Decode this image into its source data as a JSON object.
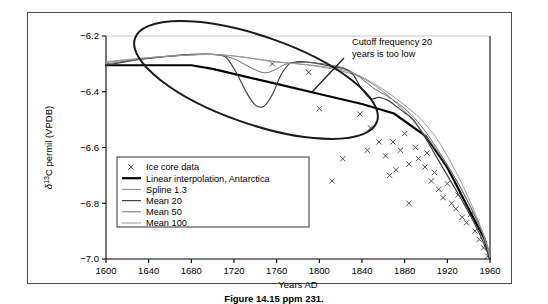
{
  "figure": {
    "caption": "Figure 14.15 ppm 231.",
    "frame_color": "#4a4a4a"
  },
  "annotation": {
    "line1": "Cutoff frequency 20",
    "line2": "years is too low",
    "ellipse_label": "highlight-ellipse"
  },
  "chart_data": {
    "type": "line",
    "title": "",
    "xlabel": "Years AD",
    "ylabel": "δ¹³C permil (VPDB)",
    "xlim": [
      1600,
      1960
    ],
    "ylim": [
      -7.0,
      -6.2
    ],
    "xticks": [
      1600,
      1640,
      1680,
      1720,
      1760,
      1800,
      1840,
      1880,
      1920,
      1960
    ],
    "yticks": [
      -6.2,
      -6.4,
      -6.6,
      -6.8,
      -7.0
    ],
    "xtick_labels": [
      "1600",
      "1640",
      "1680",
      "1720",
      "1760",
      "1800",
      "1840",
      "1880",
      "1920",
      "1960"
    ],
    "ytick_labels": [
      "−6.2",
      "−6.4",
      "−6.6",
      "−6.8",
      "−7.0"
    ],
    "grid": false,
    "legend_position": "lower-left",
    "legend": [
      {
        "label": "Ice core data",
        "marker": "x",
        "color": "#555555"
      },
      {
        "label": "Linear interpolation, Antarctica",
        "marker": "line",
        "color": "#000000",
        "width": 2.2
      },
      {
        "label": "Spline 1.3",
        "marker": "line",
        "color": "#8a8a8a",
        "width": 1.0
      },
      {
        "label": "Mean 20",
        "marker": "line",
        "color": "#404040",
        "width": 1.2
      },
      {
        "label": "Mean 50",
        "marker": "line",
        "color": "#6b6b6b",
        "width": 1.0
      },
      {
        "label": "Mean 100",
        "marker": "line",
        "color": "#9a9a9a",
        "width": 1.0
      }
    ],
    "series": [
      {
        "name": "Ice core data",
        "type": "scatter",
        "points": [
          [
            1756,
            -6.3
          ],
          [
            1790,
            -6.33
          ],
          [
            1800,
            -6.46
          ],
          [
            1838,
            -6.48
          ],
          [
            1848,
            -6.53
          ],
          [
            1856,
            -6.58
          ],
          [
            1845,
            -6.61
          ],
          [
            1822,
            -6.64
          ],
          [
            1862,
            -6.63
          ],
          [
            1869,
            -6.58
          ],
          [
            1880,
            -6.55
          ],
          [
            1876,
            -6.61
          ],
          [
            1884,
            -6.66
          ],
          [
            1812,
            -6.72
          ],
          [
            1890,
            -6.6
          ],
          [
            1893,
            -6.64
          ],
          [
            1899,
            -6.67
          ],
          [
            1905,
            -6.72
          ],
          [
            1908,
            -6.69
          ],
          [
            1912,
            -6.75
          ],
          [
            1916,
            -6.78
          ],
          [
            1920,
            -6.73
          ],
          [
            1924,
            -6.8
          ],
          [
            1928,
            -6.82
          ],
          [
            1930,
            -6.77
          ],
          [
            1934,
            -6.85
          ],
          [
            1938,
            -6.87
          ],
          [
            1942,
            -6.84
          ],
          [
            1946,
            -6.9
          ],
          [
            1950,
            -6.93
          ],
          [
            1954,
            -6.96
          ],
          [
            1958,
            -6.99
          ],
          [
            1884,
            -6.8
          ],
          [
            1866,
            -6.7
          ],
          [
            1872,
            -6.68
          ],
          [
            1901,
            -6.62
          ]
        ]
      },
      {
        "name": "Linear interpolation, Antarctica",
        "type": "line",
        "color": "#000000",
        "width": 2.2,
        "points": [
          [
            1600,
            -6.305
          ],
          [
            1680,
            -6.305
          ],
          [
            1700,
            -6.318
          ],
          [
            1760,
            -6.372
          ],
          [
            1800,
            -6.408
          ],
          [
            1840,
            -6.444
          ],
          [
            1870,
            -6.478
          ],
          [
            1900,
            -6.56
          ],
          [
            1920,
            -6.672
          ],
          [
            1940,
            -6.82
          ],
          [
            1955,
            -6.93
          ],
          [
            1960,
            -7.0
          ]
        ]
      },
      {
        "name": "Spline 1.3",
        "type": "line",
        "color": "#8a8a8a",
        "width": 1.0,
        "points": [
          [
            1600,
            -6.295
          ],
          [
            1640,
            -6.278
          ],
          [
            1680,
            -6.268
          ],
          [
            1700,
            -6.266
          ],
          [
            1720,
            -6.272
          ],
          [
            1740,
            -6.282
          ],
          [
            1760,
            -6.292
          ],
          [
            1780,
            -6.3
          ],
          [
            1800,
            -6.31
          ],
          [
            1820,
            -6.325
          ],
          [
            1840,
            -6.35
          ],
          [
            1860,
            -6.4
          ],
          [
            1880,
            -6.47
          ],
          [
            1900,
            -6.56
          ],
          [
            1920,
            -6.665
          ],
          [
            1940,
            -6.8
          ],
          [
            1955,
            -6.92
          ],
          [
            1960,
            -6.995
          ]
        ]
      },
      {
        "name": "Mean 20",
        "type": "line",
        "color": "#404040",
        "width": 1.2,
        "points": [
          [
            1600,
            -6.305
          ],
          [
            1630,
            -6.285
          ],
          [
            1660,
            -6.272
          ],
          [
            1680,
            -6.266
          ],
          [
            1700,
            -6.266
          ],
          [
            1712,
            -6.275
          ],
          [
            1722,
            -6.33
          ],
          [
            1732,
            -6.405
          ],
          [
            1740,
            -6.448
          ],
          [
            1748,
            -6.452
          ],
          [
            1756,
            -6.41
          ],
          [
            1764,
            -6.34
          ],
          [
            1772,
            -6.3
          ],
          [
            1780,
            -6.292
          ],
          [
            1790,
            -6.294
          ],
          [
            1800,
            -6.3
          ],
          [
            1812,
            -6.31
          ],
          [
            1824,
            -6.318
          ],
          [
            1832,
            -6.34
          ],
          [
            1840,
            -6.392
          ],
          [
            1848,
            -6.425
          ],
          [
            1856,
            -6.42
          ],
          [
            1864,
            -6.43
          ],
          [
            1872,
            -6.452
          ],
          [
            1880,
            -6.475
          ],
          [
            1888,
            -6.5
          ],
          [
            1896,
            -6.545
          ],
          [
            1904,
            -6.595
          ],
          [
            1912,
            -6.648
          ],
          [
            1920,
            -6.7
          ],
          [
            1928,
            -6.752
          ],
          [
            1936,
            -6.805
          ],
          [
            1944,
            -6.862
          ],
          [
            1952,
            -6.925
          ],
          [
            1960,
            -7.0
          ]
        ]
      },
      {
        "name": "Mean 50",
        "type": "line",
        "color": "#6b6b6b",
        "width": 1.0,
        "points": [
          [
            1600,
            -6.3
          ],
          [
            1640,
            -6.28
          ],
          [
            1670,
            -6.27
          ],
          [
            1690,
            -6.266
          ],
          [
            1705,
            -6.268
          ],
          [
            1720,
            -6.282
          ],
          [
            1735,
            -6.312
          ],
          [
            1748,
            -6.332
          ],
          [
            1758,
            -6.322
          ],
          [
            1768,
            -6.302
          ],
          [
            1780,
            -6.295
          ],
          [
            1795,
            -6.296
          ],
          [
            1810,
            -6.304
          ],
          [
            1825,
            -6.318
          ],
          [
            1838,
            -6.348
          ],
          [
            1850,
            -6.385
          ],
          [
            1862,
            -6.412
          ],
          [
            1874,
            -6.442
          ],
          [
            1886,
            -6.482
          ],
          [
            1898,
            -6.535
          ],
          [
            1910,
            -6.602
          ],
          [
            1922,
            -6.675
          ],
          [
            1934,
            -6.755
          ],
          [
            1946,
            -6.848
          ],
          [
            1955,
            -6.925
          ],
          [
            1960,
            -6.998
          ]
        ]
      },
      {
        "name": "Mean 100",
        "type": "line",
        "color": "#9a9a9a",
        "width": 1.0,
        "points": [
          [
            1600,
            -6.292
          ],
          [
            1645,
            -6.276
          ],
          [
            1680,
            -6.268
          ],
          [
            1705,
            -6.267
          ],
          [
            1730,
            -6.276
          ],
          [
            1755,
            -6.292
          ],
          [
            1780,
            -6.3
          ],
          [
            1805,
            -6.31
          ],
          [
            1830,
            -6.33
          ],
          [
            1850,
            -6.368
          ],
          [
            1865,
            -6.405
          ],
          [
            1880,
            -6.448
          ],
          [
            1895,
            -6.498
          ],
          [
            1910,
            -6.568
          ],
          [
            1925,
            -6.665
          ],
          [
            1940,
            -6.782
          ],
          [
            1952,
            -6.895
          ],
          [
            1960,
            -6.992
          ]
        ]
      }
    ]
  }
}
